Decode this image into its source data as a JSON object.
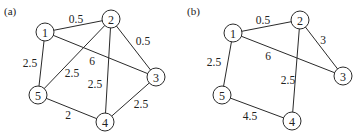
{
  "figure": {
    "panels": [
      {
        "label": "(a)",
        "label_pos": [
          4,
          15
        ],
        "nodes": [
          {
            "id": "1",
            "x": 45,
            "y": 32
          },
          {
            "id": "2",
            "x": 111,
            "y": 19
          },
          {
            "id": "3",
            "x": 156,
            "y": 77
          },
          {
            "id": "4",
            "x": 105,
            "y": 122
          },
          {
            "id": "5",
            "x": 38,
            "y": 95
          }
        ],
        "edges": [
          {
            "from": "1",
            "to": "2",
            "weight": "0.5",
            "lx": 76,
            "ly": 19
          },
          {
            "from": "2",
            "to": "3",
            "weight": "0.5",
            "lx": 143,
            "ly": 41
          },
          {
            "from": "1",
            "to": "3",
            "weight": "6",
            "lx": 92,
            "ly": 61
          },
          {
            "from": "1",
            "to": "5",
            "weight": "2.5",
            "lx": 30,
            "ly": 63
          },
          {
            "from": "2",
            "to": "5",
            "weight": "2.5",
            "lx": 72,
            "ly": 73
          },
          {
            "from": "2",
            "to": "4",
            "weight": "2.5",
            "lx": 95,
            "ly": 84
          },
          {
            "from": "3",
            "to": "4",
            "weight": "2.5",
            "lx": 141,
            "ly": 104
          },
          {
            "from": "5",
            "to": "4",
            "weight": "2",
            "lx": 68,
            "ly": 115
          }
        ]
      },
      {
        "label": "(b)",
        "label_pos": [
          187,
          15
        ],
        "nodes": [
          {
            "id": "1",
            "x": 233,
            "y": 33
          },
          {
            "id": "2",
            "x": 300,
            "y": 20
          },
          {
            "id": "3",
            "x": 343,
            "y": 76
          },
          {
            "id": "4",
            "x": 292,
            "y": 121
          },
          {
            "id": "5",
            "x": 222,
            "y": 95
          }
        ],
        "edges": [
          {
            "from": "1",
            "to": "2",
            "weight": "0.5",
            "lx": 263,
            "ly": 20
          },
          {
            "from": "2",
            "to": "3",
            "weight": "3",
            "lx": 323,
            "ly": 40
          },
          {
            "from": "1",
            "to": "3",
            "weight": "6",
            "lx": 268,
            "ly": 56
          },
          {
            "from": "1",
            "to": "5",
            "weight": "2.5",
            "lx": 214,
            "ly": 62
          },
          {
            "from": "2",
            "to": "4",
            "weight": "2.5",
            "lx": 288,
            "ly": 80
          },
          {
            "from": "5",
            "to": "4",
            "weight": "4.5",
            "lx": 250,
            "ly": 116
          }
        ]
      }
    ],
    "node_radius": 9
  }
}
